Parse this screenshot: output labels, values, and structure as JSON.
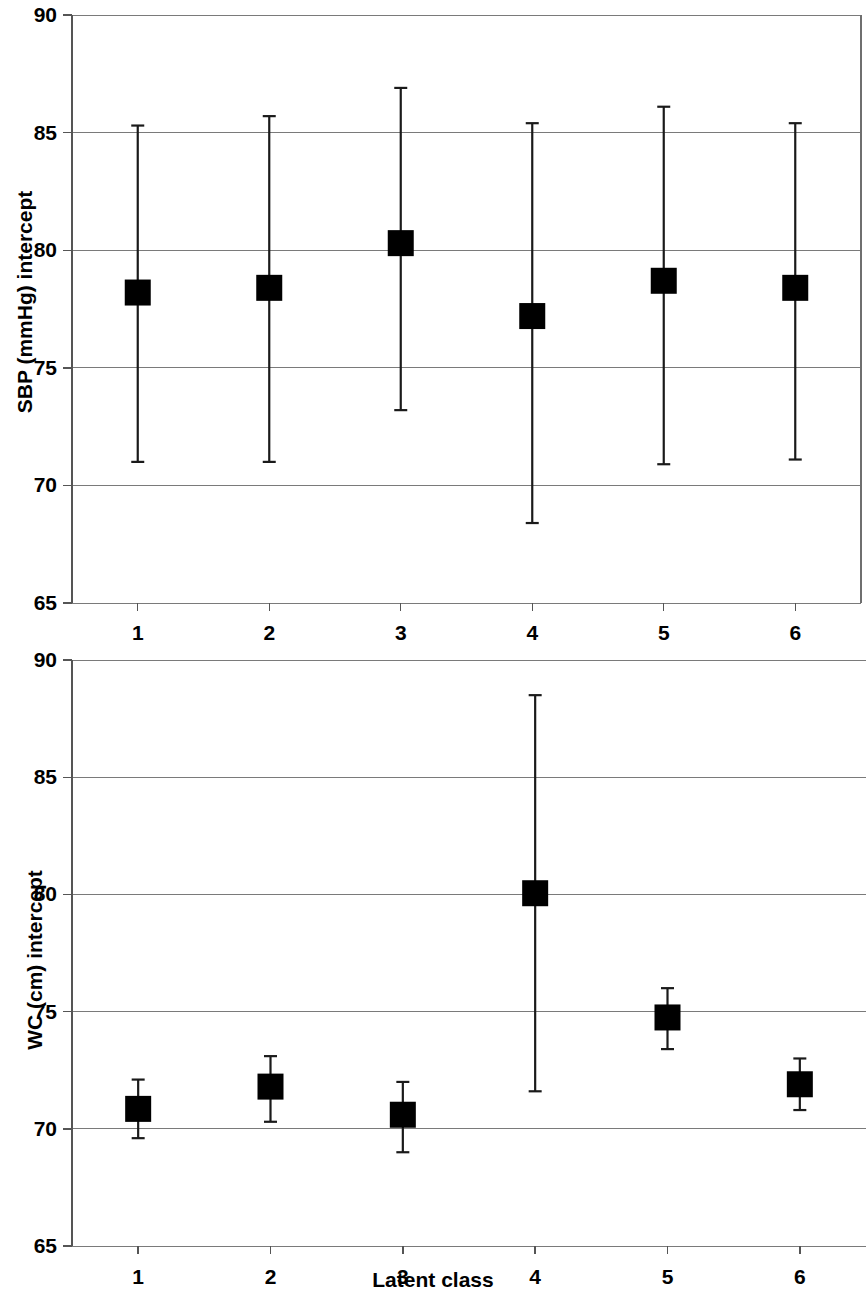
{
  "figure": {
    "background_color": "#ffffff",
    "marker_color": "#000000",
    "gridline_color": "#7a7a7a",
    "axis_color": "#555555"
  },
  "panels": [
    {
      "id": "sbp",
      "ylabel": "SBP (mmHg) intercept",
      "xlabel": "",
      "ytick_labels": [
        "90",
        "85",
        "80",
        "75",
        "70",
        "65"
      ],
      "xtick_labels": [
        "1",
        "2",
        "3",
        "4",
        "5",
        "6"
      ]
    },
    {
      "id": "wc",
      "ylabel": "WC (cm) intercept",
      "xlabel": "Latent class",
      "ytick_labels": [
        "90",
        "85",
        "80",
        "75",
        "70",
        "65"
      ],
      "xtick_labels": [
        "1",
        "2",
        "3",
        "4",
        "5",
        "6"
      ]
    }
  ],
  "chart_data": [
    {
      "type": "scatter",
      "title": "",
      "subtitle": "",
      "xlabel": "",
      "ylabel": "SBP (mmHg) intercept",
      "categories": [
        "1",
        "2",
        "3",
        "4",
        "5",
        "6"
      ],
      "x": [
        1,
        2,
        3,
        4,
        5,
        6
      ],
      "values": [
        78.2,
        78.4,
        80.3,
        77.2,
        78.7,
        78.4
      ],
      "error_low": [
        71.0,
        71.0,
        73.2,
        68.4,
        70.9,
        71.1
      ],
      "error_high": [
        85.3,
        85.7,
        86.9,
        85.4,
        86.1,
        85.4
      ],
      "error_type": "confidence-interval",
      "marker": "filled-square",
      "xlim": [
        0.5,
        6.5
      ],
      "ylim": [
        65,
        90
      ],
      "ytick_values": [
        90,
        85,
        80,
        75,
        70,
        65
      ],
      "grid": true,
      "legend": false
    },
    {
      "type": "scatter",
      "title": "",
      "subtitle": "",
      "xlabel": "Latent class",
      "ylabel": "WC (cm) intercept",
      "categories": [
        "1",
        "2",
        "3",
        "4",
        "5",
        "6"
      ],
      "x": [
        1,
        2,
        3,
        4,
        5,
        6
      ],
      "values": [
        70.85,
        71.8,
        70.6,
        80.05,
        74.75,
        71.9
      ],
      "error_low": [
        69.6,
        70.3,
        69.0,
        71.6,
        73.4,
        70.8
      ],
      "error_high": [
        72.1,
        73.1,
        72.0,
        88.5,
        76.0,
        73.0
      ],
      "error_type": "confidence-interval",
      "marker": "filled-square",
      "xlim": [
        0.5,
        6.5
      ],
      "ylim": [
        65,
        90
      ],
      "ytick_values": [
        90,
        85,
        80,
        75,
        70,
        65
      ],
      "grid": true,
      "legend": false
    }
  ]
}
